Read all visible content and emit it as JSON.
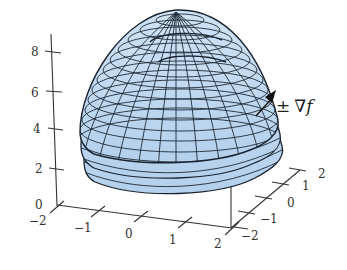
{
  "figure": {
    "type": "3d-surface-plot",
    "surface_fill": "#b7d3ee",
    "surface_fill_light": "#d5e6f7",
    "mesh_color": "#1f2a36",
    "surface_count": 3
  },
  "axes": {
    "z": {
      "ticks": [
        "0",
        "2",
        "4",
        "6",
        "8"
      ]
    },
    "x": {
      "ticks": [
        "−2",
        "−1",
        "0",
        "1",
        "2"
      ]
    },
    "y": {
      "ticks": [
        "−2",
        "−1",
        "0",
        "1",
        "2"
      ]
    }
  },
  "annotation": {
    "pm": "±",
    "nabla": "∇",
    "f": "f",
    "label": "± ∇f"
  }
}
